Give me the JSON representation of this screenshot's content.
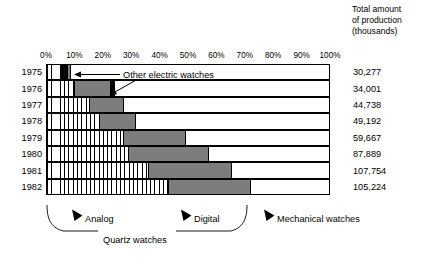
{
  "header": {
    "total_caption_line1": "Total amount",
    "total_caption_line2": "of production",
    "total_caption_line3": "(thousands)"
  },
  "annotations": {
    "other_electric_label": "Other electric watches"
  },
  "legend": {
    "analog": "Analog",
    "digital": "Digital",
    "mechanical": "Mechanical watches",
    "quartz": "Quartz watches"
  },
  "colors": {
    "analog": "#ffffff",
    "analog_hatch": "#000000",
    "digital": "#7d7d7d",
    "other_electric": "#000000",
    "mechanical": "#ffffff",
    "axis": "#000000"
  },
  "chart_data": {
    "type": "bar",
    "orientation": "horizontal",
    "stacked": true,
    "normalized": true,
    "title": "",
    "subtitle": "",
    "xlabel": "",
    "ylabel": "",
    "xlim": [
      0,
      100
    ],
    "grid": false,
    "legend_position": "bottom",
    "xtick_labels": [
      "0%",
      "10%",
      "20%",
      "30%",
      "40%",
      "50%",
      "60%",
      "70%",
      "80%",
      "90%",
      "100%"
    ],
    "xtick_values": [
      0,
      10,
      20,
      30,
      40,
      50,
      60,
      70,
      80,
      90,
      100
    ],
    "categories": [
      "1975",
      "1976",
      "1977",
      "1978",
      "1979",
      "1980",
      "1981",
      "1982"
    ],
    "series": [
      {
        "name": "Analog",
        "group": "Quartz watches",
        "values": [
          5.0,
          10.0,
          15.0,
          18.5,
          27.0,
          29.0,
          36.0,
          43.0
        ]
      },
      {
        "name": "Other electric watches",
        "group": "",
        "values": [
          2.5,
          0.0,
          0.0,
          0.0,
          0.0,
          0.0,
          0.0,
          0.0
        ]
      },
      {
        "name": "Digital",
        "group": "Quartz watches",
        "values": [
          1.0,
          12.5,
          12.0,
          13.0,
          22.0,
          28.0,
          29.0,
          29.0
        ]
      },
      {
        "name": "Other electric watches (trailing)",
        "group": "",
        "values": [
          0.0,
          1.5,
          0.0,
          0.0,
          0.0,
          0.0,
          0.0,
          0.0
        ]
      },
      {
        "name": "Mechanical watches",
        "group": "",
        "values": [
          91.5,
          76.0,
          73.0,
          68.5,
          51.0,
          43.0,
          35.0,
          28.0
        ]
      }
    ],
    "secondary_column": {
      "header": "Total amount of production (thousands)",
      "values": [
        "30,277",
        "34,001",
        "44,738",
        "49,192",
        "59,667",
        "87,889",
        "107,754",
        "105,224"
      ]
    }
  }
}
